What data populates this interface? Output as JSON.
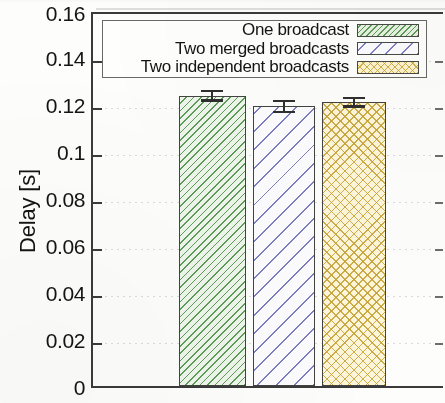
{
  "chart_data": {
    "type": "bar",
    "title": "",
    "xlabel": "",
    "ylabel": "Delay [s]",
    "ylim": [
      0,
      0.16
    ],
    "yticks": [
      "0",
      "0.02",
      "0.04",
      "0.06",
      "0.08",
      "0.1",
      "0.12",
      "0.14",
      "0.16"
    ],
    "ytick_values": [
      0,
      0.02,
      0.04,
      0.06,
      0.08,
      0.1,
      0.12,
      0.14,
      0.16
    ],
    "grid": true,
    "grid_axis": "y",
    "legend_position": "upper right",
    "categories": [
      "One broadcast",
      "Two merged broadcasts",
      "Two independent broadcasts"
    ],
    "values": [
      0.1235,
      0.119,
      0.1208
    ],
    "errors": [
      0.0025,
      0.0028,
      0.0024
    ],
    "series": [
      {
        "name": "One broadcast",
        "value": 0.1235,
        "error": 0.0025,
        "fill_color": "#eef5ea",
        "hatch_color": "#569650",
        "hatch": "diagonal-dense",
        "edge_color": "#43433f"
      },
      {
        "name": "Two merged broadcasts",
        "value": 0.119,
        "error": 0.0028,
        "fill_color": "#fcfcfe",
        "hatch_color": "#6e70b9",
        "hatch": "diagonal-sparse",
        "edge_color": "#43433f"
      },
      {
        "name": "Two independent broadcasts",
        "value": 0.1208,
        "error": 0.0024,
        "fill_color": "#fdf6da",
        "hatch_color": "#c4a030",
        "hatch": "crosshatch",
        "edge_color": "#43433f"
      }
    ]
  },
  "axis": {
    "y_title": "Delay [s]",
    "tick_0": "0",
    "tick_1": "0.02",
    "tick_2": "0.04",
    "tick_3": "0.06",
    "tick_4": "0.08",
    "tick_5": "0.1",
    "tick_6": "0.12",
    "tick_7": "0.14",
    "tick_8": "0.16"
  },
  "legend": {
    "items": [
      {
        "label": "One broadcast"
      },
      {
        "label": "Two merged broadcasts"
      },
      {
        "label": "Two independent broadcasts"
      }
    ]
  }
}
